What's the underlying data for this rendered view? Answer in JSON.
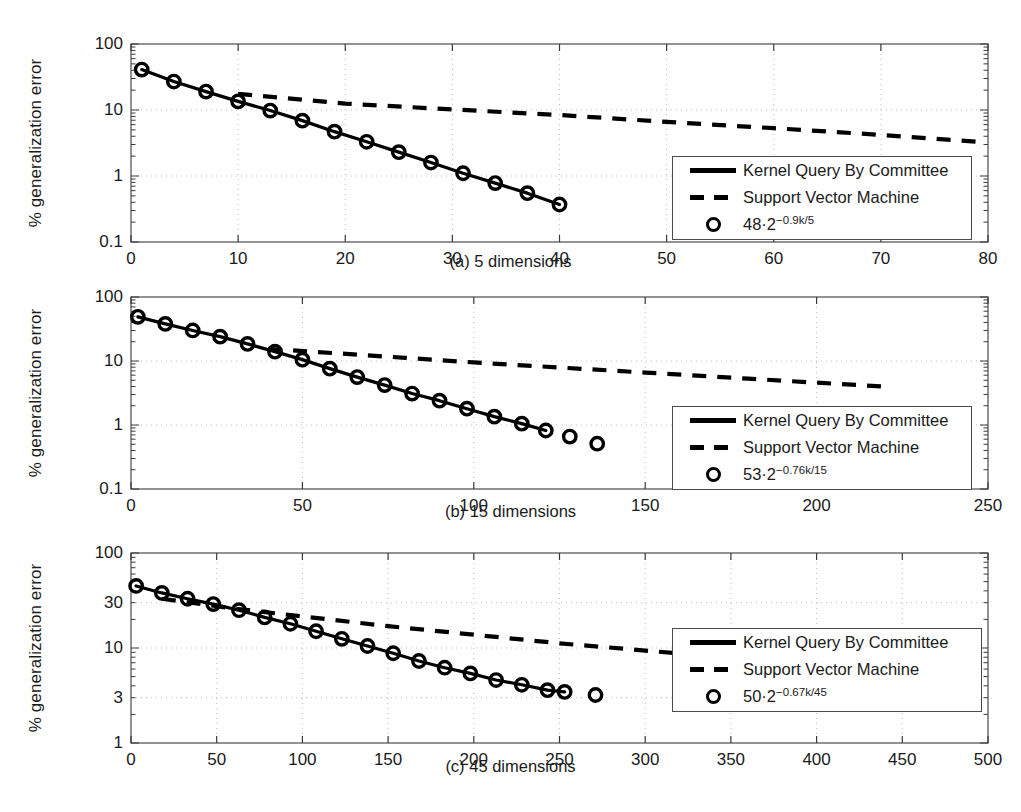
{
  "figure": {
    "y_axis_label": "% generalization error",
    "series_names": {
      "kqbc": "Kernel Query By Committee",
      "svm": "Support Vector Machine"
    }
  },
  "panels": [
    {
      "id": "a",
      "caption": "(a) 5 dimensions",
      "theory_label_base": "48·2",
      "theory_label_exp": "−0.9k/5",
      "xticks": [
        "0",
        "10",
        "20",
        "30",
        "40",
        "50",
        "60",
        "70",
        "80"
      ],
      "yticks": [
        "100",
        "10",
        "1",
        "0.1"
      ]
    },
    {
      "id": "b",
      "caption": "(b) 15 dimensions",
      "theory_label_base": "53·2",
      "theory_label_exp": "−0.76k/15",
      "xticks": [
        "0",
        "50",
        "100",
        "150",
        "200",
        "250"
      ],
      "yticks": [
        "100",
        "10",
        "1",
        "0.1"
      ]
    },
    {
      "id": "c",
      "caption": "(c) 45 dimensions",
      "theory_label_base": "50·2",
      "theory_label_exp": "−0.67k/45",
      "xticks": [
        "0",
        "50",
        "100",
        "150",
        "200",
        "250",
        "300",
        "350",
        "400",
        "450",
        "500"
      ],
      "yticks": [
        "100",
        "30",
        "10",
        "3",
        "1"
      ]
    }
  ],
  "chart_data": [
    {
      "type": "line",
      "title": "(a) 5 dimensions",
      "xlabel": "",
      "ylabel": "% generalization error",
      "yscale": "log",
      "xlim": [
        0,
        80
      ],
      "ylim": [
        0.1,
        100
      ],
      "yticks": [
        100,
        10,
        1,
        0.1
      ],
      "xticks": [
        0,
        10,
        20,
        30,
        40,
        50,
        60,
        70,
        80
      ],
      "grid": true,
      "legend_position": "lower-right",
      "series": [
        {
          "name": "Kernel Query By Committee",
          "style": "solid-with-circles",
          "x": [
            1,
            4,
            7,
            10,
            13,
            16,
            19,
            22,
            25,
            28,
            31,
            34,
            37,
            40
          ],
          "y": [
            41,
            27,
            19,
            13.5,
            9.8,
            6.9,
            4.7,
            3.3,
            2.3,
            1.6,
            1.1,
            0.78,
            0.55,
            0.37
          ]
        },
        {
          "name": "Support Vector Machine",
          "style": "dashed",
          "x": [
            10,
            20,
            30,
            40,
            50,
            60,
            70,
            79
          ],
          "y": [
            17.5,
            12.5,
            10.2,
            8.4,
            6.6,
            5.3,
            4.2,
            3.3
          ]
        },
        {
          "name": "48·2^(−0.9k/5)",
          "style": "circles",
          "x": [
            1,
            4,
            7,
            10,
            13,
            16,
            19,
            22,
            25,
            28,
            31,
            34,
            37,
            40
          ],
          "y": [
            41,
            27,
            19,
            13.5,
            9.8,
            6.9,
            4.7,
            3.3,
            2.3,
            1.6,
            1.1,
            0.78,
            0.55,
            0.37
          ]
        }
      ]
    },
    {
      "type": "line",
      "title": "(b) 15 dimensions",
      "xlabel": "",
      "ylabel": "% generalization error",
      "yscale": "log",
      "xlim": [
        0,
        250
      ],
      "ylim": [
        0.1,
        100
      ],
      "yticks": [
        100,
        10,
        1,
        0.1
      ],
      "xticks": [
        0,
        50,
        100,
        150,
        200,
        250
      ],
      "grid": true,
      "legend_position": "lower-right",
      "series": [
        {
          "name": "Kernel Query By Committee",
          "style": "solid-with-circles",
          "x": [
            2,
            10,
            18,
            26,
            34,
            42,
            50,
            58,
            66,
            74,
            82,
            90,
            98,
            106,
            114,
            121
          ],
          "y": [
            49,
            38,
            30,
            24,
            18.5,
            14,
            10.5,
            7.6,
            5.6,
            4.2,
            3.1,
            2.4,
            1.8,
            1.35,
            1.05,
            0.82
          ]
        },
        {
          "name": "Support Vector Machine",
          "style": "dashed",
          "x": [
            40,
            60,
            80,
            100,
            120,
            150,
            180,
            219
          ],
          "y": [
            15.5,
            13.2,
            11.2,
            9.5,
            8.2,
            6.6,
            5.3,
            4.0
          ]
        },
        {
          "name": "53·2^(−0.76k/15)",
          "style": "circles",
          "x": [
            2,
            10,
            18,
            26,
            34,
            42,
            50,
            58,
            66,
            74,
            82,
            90,
            98,
            106,
            114,
            121,
            128,
            136
          ],
          "y": [
            49,
            38,
            30,
            24,
            18.5,
            14,
            10.5,
            7.6,
            5.6,
            4.2,
            3.1,
            2.4,
            1.8,
            1.35,
            1.05,
            0.82,
            0.66,
            0.51
          ]
        }
      ]
    },
    {
      "type": "line",
      "title": "(c) 45 dimensions",
      "xlabel": "",
      "ylabel": "% generalization error",
      "yscale": "log",
      "xlim": [
        0,
        500
      ],
      "ylim": [
        1,
        100
      ],
      "yticks": [
        100,
        30,
        10,
        3,
        1
      ],
      "xticks": [
        0,
        50,
        100,
        150,
        200,
        250,
        300,
        350,
        400,
        450,
        500
      ],
      "grid": true,
      "legend_position": "lower-right",
      "series": [
        {
          "name": "Kernel Query By Committee",
          "style": "solid-with-circles",
          "x": [
            3,
            18,
            33,
            48,
            63,
            78,
            93,
            108,
            123,
            138,
            153,
            168,
            183,
            198,
            213,
            228,
            243,
            253
          ],
          "y": [
            45,
            38,
            33,
            29,
            25,
            21,
            18,
            15,
            12.5,
            10.5,
            8.8,
            7.3,
            6.2,
            5.4,
            4.6,
            4.1,
            3.6,
            3.45
          ]
        },
        {
          "name": "Support Vector Machine",
          "style": "dashed",
          "x": [
            18,
            60,
            100,
            150,
            200,
            250,
            300,
            360,
            430,
            490
          ],
          "y": [
            33,
            26,
            21.5,
            17,
            13.8,
            11.2,
            9.4,
            7.6,
            6.2,
            5.2
          ]
        },
        {
          "name": "50·2^(−0.67k/45)",
          "style": "circles",
          "x": [
            3,
            18,
            33,
            48,
            63,
            78,
            93,
            108,
            123,
            138,
            153,
            168,
            183,
            198,
            213,
            228,
            243,
            253,
            271
          ],
          "y": [
            45,
            38,
            33,
            29,
            25,
            21,
            18,
            15,
            12.5,
            10.5,
            8.8,
            7.3,
            6.2,
            5.4,
            4.6,
            4.1,
            3.6,
            3.45,
            3.2
          ]
        }
      ]
    }
  ]
}
